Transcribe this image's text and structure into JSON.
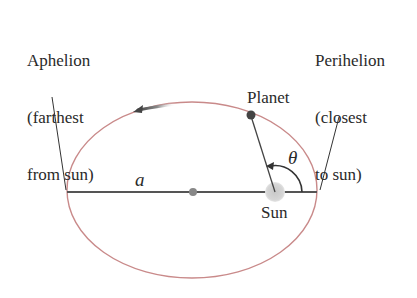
{
  "diagram": {
    "labels": {
      "aphelion": [
        "Aphelion",
        "(farthest",
        "from sun)"
      ],
      "perihelion": [
        "Perihelion",
        "(closest",
        "to sun)"
      ],
      "planet": "Planet",
      "sun": "Sun",
      "semi_major_axis": "a",
      "angle": "θ"
    },
    "colors": {
      "orbit": "#c98a8a",
      "axis": "#555555",
      "leader": "#333333",
      "planet": "#444444",
      "center_dot": "#888888",
      "sun": "#cccccc",
      "arrow": "#555555",
      "text": "#2a2a2a"
    },
    "geometry": {
      "ellipse_center": [
        192,
        190
      ],
      "ellipse_rx": 125,
      "ellipse_ry": 88,
      "sun_position": [
        275,
        192
      ],
      "planet_position": [
        251,
        115
      ],
      "motion_direction": "counterclockwise"
    }
  }
}
